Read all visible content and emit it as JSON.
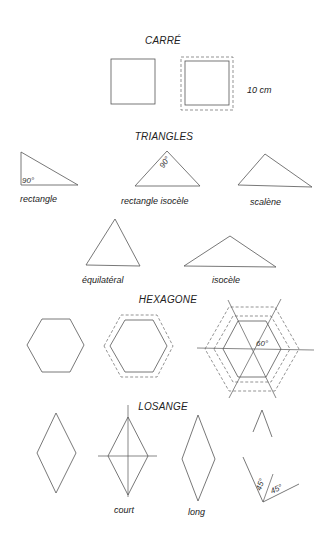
{
  "sections": {
    "carre": {
      "title": "CARRÉ",
      "dimension_label": "10 cm"
    },
    "triangles": {
      "title": "TRIANGLES",
      "items": [
        {
          "label": "rectangle",
          "angle": "90°"
        },
        {
          "label": "rectangle isocèle",
          "angle": "90°"
        },
        {
          "label": "scalène"
        },
        {
          "label": "équilatéral"
        },
        {
          "label": "isocèle"
        }
      ]
    },
    "hexagone": {
      "title": "HEXAGONE",
      "angle": "60°"
    },
    "losange": {
      "title": "LOSANGE",
      "items": [
        {
          "label": ""
        },
        {
          "label": "court"
        },
        {
          "label": "long"
        }
      ],
      "angle_a": "45°",
      "angle_b": "45°"
    }
  },
  "colors": {
    "line": "#555555",
    "text": "#222222",
    "background": "#ffffff"
  }
}
